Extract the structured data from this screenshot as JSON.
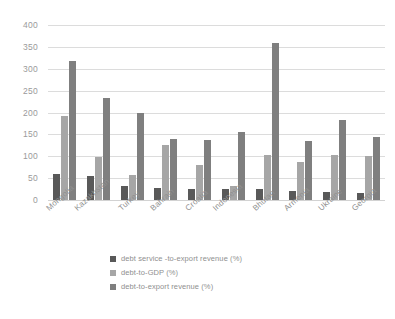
{
  "chart_data": {
    "type": "bar",
    "title": "",
    "xlabel": "",
    "ylabel": "",
    "ylim": [
      0,
      400
    ],
    "yticks": [
      0,
      50,
      100,
      150,
      200,
      250,
      300,
      350,
      400
    ],
    "grid": true,
    "legend_position": "bottom",
    "categories": [
      "Mongolia",
      "Kazakhstan",
      "Turkey",
      "Bahrain",
      "Croatia",
      "Indonesia",
      "Bhutan",
      "Armenia",
      "Ukraine",
      "Georgia"
    ],
    "series": [
      {
        "name": "debt service -to-export revenue (%)",
        "color": "#595959",
        "values": [
          60,
          55,
          32,
          27,
          25,
          25,
          25,
          20,
          19,
          16
        ]
      },
      {
        "name": "debt-to-GDP (%)",
        "color": "#a6a6a6",
        "values": [
          192,
          99,
          58,
          126,
          81,
          33,
          102,
          88,
          103,
          101
        ]
      },
      {
        "name": "debt-to-export revenue (%)",
        "color": "#7f7f7f",
        "values": [
          318,
          234,
          199,
          139,
          137,
          156,
          358,
          134,
          184,
          143
        ]
      }
    ]
  },
  "colors": {
    "gridline": "#dcdcdc",
    "axis_text": "#9a9a9a",
    "background": "#ffffff"
  }
}
